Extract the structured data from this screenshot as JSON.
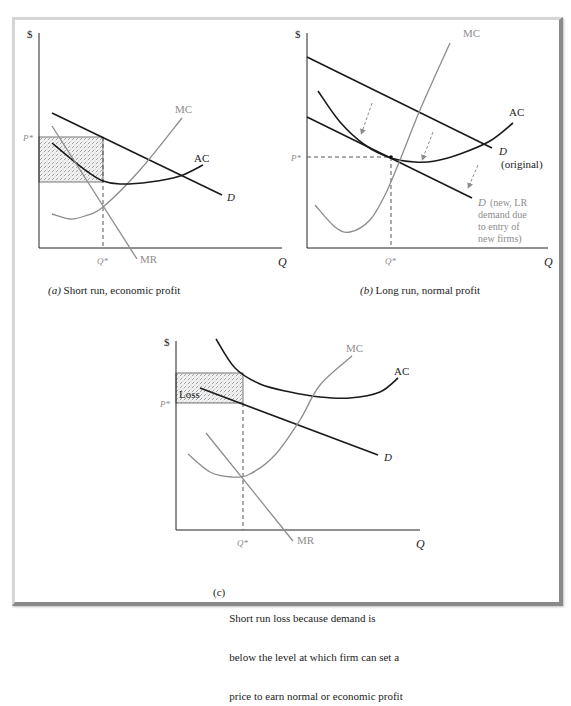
{
  "figure": {
    "colors": {
      "frame_light": "#d6d6d6",
      "frame_dark": "#8a8a8a",
      "dark_curve": "#1a1a1a",
      "gray_curve": "#8c8c8c",
      "gray_label": "#8c8c8c",
      "hatch_fill": "#eeeeee"
    },
    "panels": [
      {
        "id": "a",
        "caption_prefix": "(a)",
        "caption": "Short run, economic profit",
        "axes": {
          "origin": [
            39,
            248
          ],
          "y_top": 33,
          "x_right": 282,
          "y_label": "$",
          "x_label": "Q"
        },
        "ticks": {
          "p_star_label": "P*",
          "p_star_y": 137,
          "q_star_label": "Q*",
          "q_star_x": 103
        },
        "shaded_rect": {
          "x": 39,
          "y": 137,
          "w": 64,
          "h": 45,
          "label": ""
        },
        "curves": [
          {
            "name": "D",
            "label": "D",
            "color": "dark",
            "points": [
              [
                52,
                113
              ],
              [
                222,
                195
              ]
            ],
            "label_pos": [
              227,
              201
            ],
            "italic": true
          },
          {
            "name": "MC",
            "label": "MC",
            "color": "gray",
            "points": [
              [
                52,
                214
              ],
              [
                70,
                219
              ],
              [
                85,
                216
              ],
              [
                103,
                207
              ],
              [
                140,
                170
              ],
              [
                182,
                118
              ]
            ],
            "label_pos": [
              175,
              113
            ],
            "italic": false
          },
          {
            "name": "AC",
            "label": "AC",
            "color": "dark",
            "points": [
              [
                52,
                143
              ],
              [
                70,
                158
              ],
              [
                88,
                172
              ],
              [
                103,
                181
              ],
              [
                120,
                184
              ],
              [
                150,
                182
              ],
              [
                180,
                176
              ],
              [
                203,
                165
              ]
            ],
            "label_pos": [
              194,
              162
            ],
            "italic": false
          },
          {
            "name": "MR",
            "label": "MR",
            "color": "gray",
            "points": [
              [
                52,
                126
              ],
              [
                137,
                259
              ]
            ],
            "label_pos": [
              140,
              263
            ],
            "italic": false
          }
        ],
        "dashed_lines": [
          [
            [
              103,
              137
            ],
            [
              103,
              248
            ]
          ]
        ],
        "arrows": []
      },
      {
        "id": "b",
        "caption_prefix": "(b)",
        "caption": "Long run, normal profit",
        "axes": {
          "origin": [
            307,
            248
          ],
          "y_top": 33,
          "x_right": 548,
          "y_label": "$",
          "x_label": "Q"
        },
        "ticks": {
          "p_star_label": "P*",
          "p_star_y": 157,
          "q_star_label": "Q*",
          "q_star_x": 391
        },
        "shaded_rect": null,
        "curves": [
          {
            "name": "D-original",
            "label": "D",
            "label2": "(original)",
            "color": "dark",
            "points": [
              [
                307,
                57
              ],
              [
                492,
                148
              ]
            ],
            "label_pos": [
              499,
              155
            ],
            "italic": true
          },
          {
            "name": "D-new",
            "label": "D",
            "label_extra": [
              "(new, LR",
              "demand due",
              "to entry of",
              "new firms)"
            ],
            "color": "dark",
            "points": [
              [
                307,
                117
              ],
              [
                472,
                198
              ]
            ],
            "label_pos": [
              478,
              206
            ],
            "italic": true,
            "label_gray": true
          },
          {
            "name": "AC",
            "label": "AC",
            "color": "dark",
            "points": [
              [
                318,
                91
              ],
              [
                340,
                122
              ],
              [
                365,
                145
              ],
              [
                391,
                158
              ],
              [
                415,
                162
              ],
              [
                435,
                161
              ],
              [
                460,
                154
              ],
              [
                490,
                141
              ],
              [
                513,
                123
              ]
            ],
            "label_pos": [
              509,
              116
            ],
            "italic": false
          },
          {
            "name": "MC",
            "label": "MC",
            "color": "gray",
            "points": [
              [
                315,
                205
              ],
              [
                335,
                227
              ],
              [
                350,
                232
              ],
              [
                370,
                220
              ],
              [
                385,
                195
              ],
              [
                400,
                160
              ],
              [
                420,
                110
              ],
              [
                450,
                43
              ]
            ],
            "label_pos": [
              463,
              37
            ],
            "italic": false
          }
        ],
        "dashed_lines": [
          [
            [
              307,
              157
            ],
            [
              391,
              157
            ]
          ],
          [
            [
              391,
              157
            ],
            [
              391,
              248
            ]
          ]
        ],
        "arrows": [
          [
            [
              372,
              103
            ],
            [
              362,
              132
            ]
          ],
          [
            [
              433,
              132
            ],
            [
              423,
              158
            ]
          ],
          [
            [
              478,
              165
            ],
            [
              469,
              186
            ]
          ]
        ],
        "point": [
          391,
          157
        ]
      },
      {
        "id": "c",
        "caption_prefix": "(c)",
        "caption_lines": [
          "Short run loss because demand is",
          "below the level at which firm can set a",
          "price to earn normal or economic profit"
        ],
        "axes": {
          "origin": [
            176,
            530
          ],
          "y_top": 341,
          "x_right": 420,
          "y_label": "$",
          "x_label": "Q"
        },
        "ticks": {
          "p_star_label": "P*",
          "p_star_y": 403,
          "q_star_label": "Q*",
          "q_star_x": 243
        },
        "shaded_rect": {
          "x": 176,
          "y": 373,
          "w": 67,
          "h": 30,
          "label": "Loss"
        },
        "curves": [
          {
            "name": "AC",
            "label": "AC",
            "color": "dark",
            "points": [
              [
                216,
                339
              ],
              [
                235,
                368
              ],
              [
                260,
                384
              ],
              [
                290,
                392
              ],
              [
                320,
                397
              ],
              [
                350,
                398
              ],
              [
                380,
                392
              ],
              [
                398,
                378
              ]
            ],
            "label_pos": [
              394,
              375
            ],
            "italic": false
          },
          {
            "name": "D",
            "label": "D",
            "color": "dark",
            "points": [
              [
                200,
                388
              ],
              [
                378,
                455
              ]
            ],
            "label_pos": [
              384,
              461
            ],
            "italic": true
          },
          {
            "name": "MC",
            "label": "MC",
            "color": "gray",
            "points": [
              [
                188,
                454
              ],
              [
                210,
                472
              ],
              [
                232,
                477
              ],
              [
                250,
                474
              ],
              [
                275,
                455
              ],
              [
                300,
                420
              ],
              [
                320,
                385
              ],
              [
                352,
                356
              ]
            ],
            "label_pos": [
              346,
              352
            ],
            "italic": false
          },
          {
            "name": "MR",
            "label": "MR",
            "color": "gray",
            "points": [
              [
                206,
                433
              ],
              [
                293,
                541
              ]
            ],
            "label_pos": [
              297,
              544
            ],
            "italic": false
          }
        ],
        "dashed_lines": [
          [
            [
              243,
              403
            ],
            [
              243,
              530
            ]
          ]
        ],
        "arrows": []
      }
    ]
  }
}
